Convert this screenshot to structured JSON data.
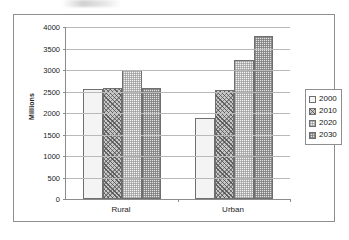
{
  "chart_data": {
    "type": "bar",
    "title": "",
    "subtitle": "",
    "xlabel": "",
    "ylabel": "Millions",
    "categories": [
      "Rural",
      "Urban"
    ],
    "series": [
      {
        "name": "2000",
        "values": [
          2560,
          1880
        ],
        "swatch": "white-plain"
      },
      {
        "name": "2010",
        "values": [
          2590,
          2530
        ],
        "swatch": "dark-crosshatch"
      },
      {
        "name": "2020",
        "values": [
          3000,
          3230
        ],
        "swatch": "light-dotted"
      },
      {
        "name": "2030",
        "values": [
          2590,
          3800
        ],
        "swatch": "medium-dotted"
      }
    ],
    "ylim": [
      0,
      4000
    ],
    "ytick_step": 500,
    "yticks": [
      "0",
      "500",
      "1000",
      "1500",
      "2000",
      "2500",
      "3000",
      "3500",
      "4000"
    ],
    "grid": true,
    "legend_position": "right",
    "border": true,
    "colors": {
      "axis": "#8c8c8c",
      "grid": "#b9b9b9",
      "frame": "#8e8e8e",
      "text": "#1b1b1b",
      "series_2000": "#f4f4f4",
      "series_2010": "#c9c9c9",
      "series_2020": "#f2f2f2",
      "series_2030": "#e3e3e3"
    }
  },
  "legend": {
    "items": [
      {
        "label": "2000"
      },
      {
        "label": "2010"
      },
      {
        "label": "2020"
      },
      {
        "label": "2030"
      }
    ]
  }
}
